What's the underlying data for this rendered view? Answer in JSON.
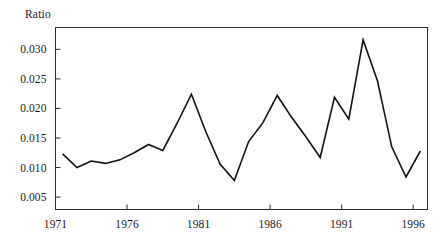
{
  "chart_data": {
    "type": "line",
    "title": "",
    "subtitle": "",
    "xlabel": "",
    "ylabel": "Ratio",
    "ylabel_position": "top-left",
    "grid": false,
    "legend": null,
    "legend_position": "none",
    "xlim": [
      1971,
      1997
    ],
    "ylim": [
      0.0029,
      0.0337
    ],
    "xticks": [
      1971,
      1976,
      1981,
      1986,
      1991,
      1996
    ],
    "xtick_labels": [
      "1971",
      "1976",
      "1981",
      "1986",
      "1991",
      "1996"
    ],
    "yticks": [
      0.005,
      0.01,
      0.015,
      0.02,
      0.025,
      0.03
    ],
    "ytick_labels": [
      "0.005",
      "0.010",
      "0.015",
      "0.020",
      "0.025",
      "0.030"
    ],
    "line_color": "#111111",
    "line_width": 1.6,
    "x": [
      1971.5,
      1972.5,
      1973.5,
      1974.5,
      1975.5,
      1976.5,
      1977.5,
      1978.5,
      1979.5,
      1980.5,
      1981.5,
      1982.5,
      1983.5,
      1984.5,
      1985.5,
      1986.5,
      1987.5,
      1988.5,
      1989.5,
      1990.5,
      1991.5,
      1992.5,
      1993.5,
      1994.5,
      1995.5,
      1996.5
    ],
    "values": [
      0.0123,
      0.01,
      0.0111,
      0.0107,
      0.0113,
      0.0125,
      0.0139,
      0.0129,
      0.0175,
      0.0224,
      0.0161,
      0.0106,
      0.0078,
      0.0144,
      0.0176,
      0.0222,
      0.0185,
      0.0152,
      0.0117,
      0.0219,
      0.0182,
      0.0316,
      0.0247,
      0.0135,
      0.0084,
      0.0128
    ],
    "series_name": "Ratio",
    "annotations": []
  },
  "axes": {
    "frame_color": "#2b2b2b",
    "background": "#ffffff"
  }
}
